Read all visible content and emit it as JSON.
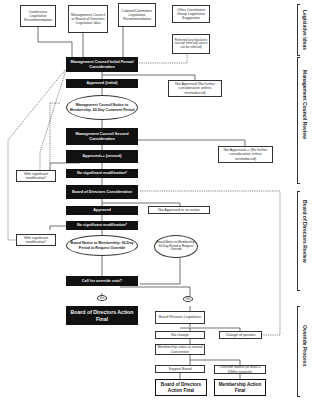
{
  "sources": {
    "conference": "Conference Legislative Recommendation",
    "mgmt_board": "Management Council or Board of Directors Legislative Idea",
    "cabinet": "Cabinet/Committee Legislative Recommendation",
    "other": "Other Constituent Group Legislative Suggestion",
    "referred": "Referred (any legislative concept from any source can be referred)"
  },
  "mgmt_review": {
    "initial_consideration": "Management Council Initial Formal Consideration",
    "approved_initial": "Approved (initial)",
    "not_approved": "Not Approved (No further consideration unless reintroduced)",
    "notice": "Management Council Notice to Membership, 60-Day Comment Period",
    "second_consideration": "Management Council Second Consideration",
    "approved_second": "Approved++ (second)",
    "not_approved_second": "Not Approved++ (No further consideration unless reintroduced)",
    "with_mod": "With significant modification*",
    "no_mod": "No significant modification*"
  },
  "board_review": {
    "consideration": "Board of Directors Consideration",
    "approved": "Approved",
    "not_approved": "Not Approved or no action",
    "with_mod": "With significant modification*",
    "no_mod": "No significant modification*",
    "notice_left": "Board Notice to Membership: 60-Day Period to Request Override",
    "notice_right": "Board Notice to Membership: 60-Day Period to Request Override",
    "call_override": "Call for override vote?"
  },
  "override": {
    "yes_left": "Yes",
    "yes_right": "Yes",
    "board_final_top": "Board of Directors Action Final",
    "board_reviews": "Board Reviews Legislation",
    "no_change": "No change",
    "change_position": "Change of position",
    "membership_votes": "Membership votes at annual Convention",
    "support_board": "Support Board",
    "override_board": "Override Board (at least a 5/8ths majority)",
    "board_final_bottom": "Board of Directors Action Final",
    "membership_final": "Membership Action Final"
  },
  "side_labels": {
    "legislative_ideas": "Legislative Ideas",
    "mgmt_council_review": "Management Council Review",
    "board_review": "Board of Directors Review",
    "override_process": "Override Process"
  }
}
